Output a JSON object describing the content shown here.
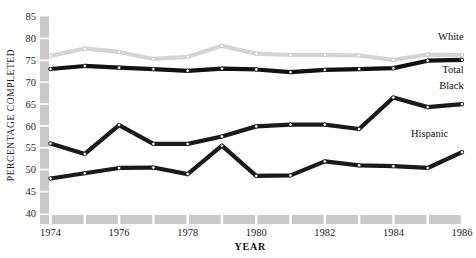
{
  "chart_data": {
    "type": "line",
    "title": "",
    "xlabel": "YEAR",
    "ylabel": "PERCENTAGE COMPLETED",
    "x": [
      1974,
      1975,
      1976,
      1977,
      1978,
      1979,
      1980,
      1981,
      1982,
      1983,
      1984,
      1985,
      1986
    ],
    "xtick_labels": [
      "1974",
      "1976",
      "1978",
      "1980",
      "1982",
      "1984",
      "1986"
    ],
    "xtick_values": [
      1974,
      1976,
      1978,
      1980,
      1982,
      1984,
      1986
    ],
    "ytick_labels": [
      "40",
      "45",
      "50",
      "55",
      "60",
      "65",
      "70",
      "75",
      "80",
      "85"
    ],
    "ytick_values": [
      40,
      45,
      50,
      55,
      60,
      65,
      70,
      75,
      80,
      85
    ],
    "xlim": [
      1974,
      1986
    ],
    "ylim": [
      40,
      85
    ],
    "grid": false,
    "legend_position": "right-inline",
    "series": [
      {
        "name": "White",
        "color": "#d4d4d4",
        "values": [
          76.0,
          77.7,
          76.9,
          75.3,
          75.8,
          78.3,
          76.5,
          76.2,
          76.2,
          76.1,
          75.1,
          76.3,
          76.2
        ]
      },
      {
        "name": "Total",
        "color": "#111111",
        "values": [
          73.0,
          73.7,
          73.3,
          73.0,
          72.6,
          73.1,
          72.9,
          72.3,
          72.8,
          73.0,
          73.2,
          74.9,
          75.1
        ]
      },
      {
        "name": "Black",
        "color": "#1a1a1a",
        "values": [
          56.0,
          53.6,
          60.2,
          55.9,
          55.9,
          57.6,
          59.9,
          60.3,
          60.3,
          59.3,
          66.5,
          64.3,
          65.0
        ]
      },
      {
        "name": "Hispanic",
        "color": "#1a1a1a",
        "values": [
          48.0,
          49.2,
          50.4,
          50.5,
          49.0,
          55.5,
          48.6,
          48.7,
          51.9,
          51.0,
          50.8,
          50.4,
          54.0
        ]
      }
    ],
    "annotations": [
      {
        "text": "White",
        "x": 1986.05,
        "y": 79.6
      },
      {
        "text": "Total",
        "x": 1986.05,
        "y": 72.0
      },
      {
        "text": "Black",
        "x": 1986.05,
        "y": 68.4
      },
      {
        "text": "Hispanic",
        "x": 1985.6,
        "y": 57.4
      }
    ],
    "axis_band_color": "#c9c9c9",
    "marker_face_color": "#ffffff",
    "marker_edge_color": "#111111"
  }
}
